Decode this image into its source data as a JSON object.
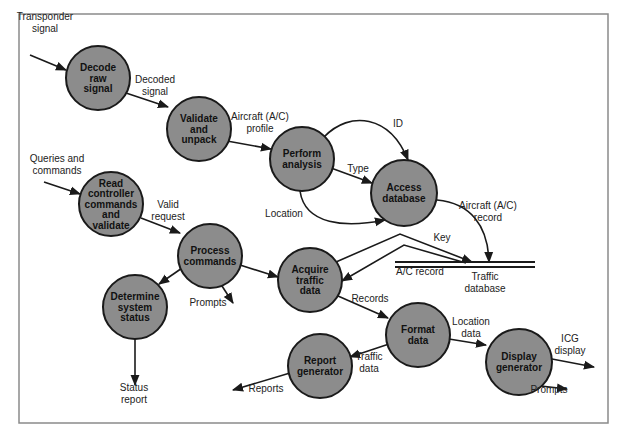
{
  "diagram": {
    "type": "data-flow-diagram",
    "processes": [
      {
        "id": "decode",
        "lines": [
          "Decode",
          "raw",
          "signal"
        ],
        "cx": 98,
        "cy": 78,
        "r": 32
      },
      {
        "id": "validate",
        "lines": [
          "Validate",
          "and",
          "unpack"
        ],
        "cx": 199,
        "cy": 129,
        "r": 32
      },
      {
        "id": "analysis",
        "lines": [
          "Perform",
          "analysis"
        ],
        "cx": 302,
        "cy": 159,
        "r": 32
      },
      {
        "id": "access",
        "lines": [
          "Access",
          "database"
        ],
        "cx": 404,
        "cy": 193,
        "r": 33
      },
      {
        "id": "read",
        "lines": [
          "Read",
          "controller",
          "commands",
          "and",
          "validate"
        ],
        "cx": 111,
        "cy": 204,
        "r": 32
      },
      {
        "id": "process",
        "lines": [
          "Process",
          "commands"
        ],
        "cx": 210,
        "cy": 256,
        "r": 32
      },
      {
        "id": "acquire",
        "lines": [
          "Acquire",
          "traffic",
          "data"
        ],
        "cx": 310,
        "cy": 280,
        "r": 32
      },
      {
        "id": "status",
        "lines": [
          "Determine",
          "system",
          "status"
        ],
        "cx": 135,
        "cy": 307,
        "r": 32
      },
      {
        "id": "format",
        "lines": [
          "Format",
          "data"
        ],
        "cx": 418,
        "cy": 335,
        "r": 32
      },
      {
        "id": "report",
        "lines": [
          "Report",
          "generator"
        ],
        "cx": 320,
        "cy": 366,
        "r": 32
      },
      {
        "id": "display",
        "lines": [
          "Display",
          "generator"
        ],
        "cx": 519,
        "cy": 362,
        "r": 33
      }
    ],
    "data_store": {
      "id": "traffic-db",
      "label_lines": [
        "Traffic",
        "database"
      ],
      "x1": 395,
      "x2": 535,
      "y": 262
    },
    "flows": [
      {
        "id": "transponder-signal",
        "label": [
          "Transponder",
          "signal"
        ],
        "lx": 45,
        "ly": 20,
        "path": "M30 55 L66 70"
      },
      {
        "id": "decoded-signal",
        "label": [
          "Decoded",
          "signal"
        ],
        "lx": 155,
        "ly": 83,
        "path": "M126 93 L168 107"
      },
      {
        "id": "aircraft-profile",
        "label": [
          "Aircraft (A/C)",
          "profile"
        ],
        "lx": 260,
        "ly": 120,
        "path": "M227 141 L271 149"
      },
      {
        "id": "id",
        "label": [
          "ID"
        ],
        "lx": 398,
        "ly": 127,
        "path": "M324 137 C350 110 390 115 408 160"
      },
      {
        "id": "type",
        "label": [
          "Type"
        ],
        "lx": 358,
        "ly": 172,
        "path": "M331 168 L372 183"
      },
      {
        "id": "location",
        "label": [
          "Location"
        ],
        "lx": 284,
        "ly": 217,
        "path": "M300 191 C305 225 345 228 385 220"
      },
      {
        "id": "aircraft-record",
        "label": [
          "Aircraft (A/C)",
          "record"
        ],
        "lx": 488,
        "ly": 209,
        "path": "M437 200 C470 203 488 225 489 262"
      },
      {
        "id": "key",
        "label": [
          "Key"
        ],
        "lx": 442,
        "ly": 241,
        "path": "M336 262 L400 234 L472 262"
      },
      {
        "id": "ac-record",
        "label": [
          "A/C record"
        ],
        "lx": 420,
        "ly": 275,
        "path": "M466 263 L404 245 L342 281"
      },
      {
        "id": "queries-commands",
        "label": [
          "Queries and",
          "commands"
        ],
        "lx": 57,
        "ly": 162,
        "path": "M44 182 L80 194"
      },
      {
        "id": "valid-request",
        "label": [
          "Valid",
          "request"
        ],
        "lx": 168,
        "ly": 208,
        "path": "M141 218 L180 233"
      },
      {
        "id": "pc-to-acquire",
        "label": [],
        "lx": 0,
        "ly": 0,
        "path": "M240 265 L278 277"
      },
      {
        "id": "pc-to-status",
        "label": [],
        "lx": 0,
        "ly": 0,
        "path": "M185 266 L159 284"
      },
      {
        "id": "prompts-1",
        "label": [
          "Prompts"
        ],
        "lx": 208,
        "ly": 306,
        "path": "M222 286 L233 303"
      },
      {
        "id": "status-report",
        "label": [
          "Status",
          "report"
        ],
        "lx": 134,
        "ly": 391,
        "path": "M135 339 L135 385"
      },
      {
        "id": "records",
        "label": [
          "Records"
        ],
        "lx": 370,
        "ly": 302,
        "path": "M338 296 L388 318"
      },
      {
        "id": "location-data",
        "label": [
          "Location",
          "data"
        ],
        "lx": 471,
        "ly": 325,
        "path": "M449 339 L486 345"
      },
      {
        "id": "traffic-data",
        "label": [
          "Traffic",
          "data"
        ],
        "lx": 369,
        "ly": 360,
        "path": "M389 344 L350 357"
      },
      {
        "id": "reports",
        "label": [
          "Reports"
        ],
        "lx": 266,
        "ly": 392,
        "path": "M290 373 L233 390"
      },
      {
        "id": "icg-display",
        "label": [
          "ICG",
          "display"
        ],
        "lx": 570,
        "ly": 342,
        "path": "M552 359 L594 367"
      },
      {
        "id": "prompts-2",
        "label": [
          "Prompts"
        ],
        "lx": 549,
        "ly": 393,
        "path": "M541 386 L567 389"
      }
    ]
  }
}
